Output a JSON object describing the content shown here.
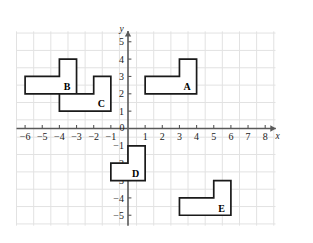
{
  "chart_data": {
    "type": "scatter",
    "title": "",
    "xlabel": "x",
    "ylabel": "y",
    "grid": true,
    "legend": "none",
    "xlim": [
      -6.5,
      8.6
    ],
    "ylim": [
      -5.6,
      5.6
    ],
    "xticks": [
      -6,
      -5,
      -4,
      -3,
      -2,
      -1,
      0,
      1,
      2,
      3,
      4,
      5,
      6,
      7,
      8
    ],
    "yticks": [
      5,
      4,
      3,
      2,
      1,
      -1,
      -2,
      -3,
      -4,
      -5
    ],
    "xtick_labels": [
      "−6",
      "−5",
      "−4",
      "−3",
      "−2",
      "−1",
      "0",
      "1",
      "2",
      "3",
      "4",
      "5",
      "6",
      "7",
      "8"
    ],
    "ytick_labels": [
      "5",
      "4",
      "3",
      "2",
      "1",
      "−1",
      "−2",
      "−3",
      "−4",
      "−5"
    ],
    "origin_label": "0",
    "axis_color": "#595959",
    "grid_color": "#e2e2e2",
    "shape_color": "#1a1a1a",
    "shapes": [
      {
        "name": "A",
        "label": "A",
        "label_at": [
          3.45,
          2.45
        ],
        "vertices": [
          [
            1,
            2
          ],
          [
            4,
            2
          ],
          [
            4,
            4
          ],
          [
            3,
            4
          ],
          [
            3,
            3
          ],
          [
            1,
            3
          ]
        ]
      },
      {
        "name": "B",
        "label": "B",
        "label_at": [
          -3.55,
          2.45
        ],
        "vertices": [
          [
            -6,
            2
          ],
          [
            -3,
            2
          ],
          [
            -3,
            4
          ],
          [
            -4,
            4
          ],
          [
            -4,
            3
          ],
          [
            -6,
            3
          ]
        ]
      },
      {
        "name": "C",
        "label": "C",
        "label_at": [
          -1.55,
          1.45
        ],
        "vertices": [
          [
            -4,
            1
          ],
          [
            -1,
            1
          ],
          [
            -1,
            3
          ],
          [
            -2,
            3
          ],
          [
            -2,
            2
          ],
          [
            -4,
            2
          ]
        ]
      },
      {
        "name": "D",
        "label": "D",
        "label_at": [
          0.45,
          -2.6
        ],
        "vertices": [
          [
            -1,
            -2
          ],
          [
            0,
            -2
          ],
          [
            0,
            -1
          ],
          [
            1,
            -1
          ],
          [
            1,
            -3
          ],
          [
            -1,
            -3
          ]
        ]
      },
      {
        "name": "E",
        "label": "E",
        "label_at": [
          5.45,
          -4.6
        ],
        "vertices": [
          [
            3,
            -4
          ],
          [
            5,
            -4
          ],
          [
            5,
            -3
          ],
          [
            6,
            -3
          ],
          [
            6,
            -5
          ],
          [
            3,
            -5
          ]
        ]
      }
    ]
  }
}
